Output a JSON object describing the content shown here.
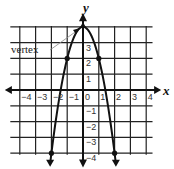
{
  "chart_data": {
    "type": "line",
    "title": "",
    "xlabel": "x",
    "ylabel": "y",
    "xlim": [
      -4.5,
      4.5
    ],
    "ylim": [
      -4.5,
      4.5
    ],
    "grid": true,
    "x_ticks": [
      "−4",
      "−3",
      "−2",
      "−1",
      "0",
      "1",
      "2",
      "3",
      "4"
    ],
    "y_ticks": [
      "−4",
      "−3",
      "−2",
      "−1",
      "1",
      "2",
      "3"
    ],
    "function": "y = 4 - 2x^2",
    "series": [
      {
        "name": "parabola",
        "x": [
          -2,
          -1,
          0,
          1,
          2
        ],
        "y": [
          -4,
          2,
          4,
          2,
          -4
        ]
      }
    ],
    "points": [
      {
        "x": -2,
        "y": -4
      },
      {
        "x": -1,
        "y": 2
      },
      {
        "x": 0,
        "y": 4
      },
      {
        "x": 1,
        "y": 2
      },
      {
        "x": 2,
        "y": -4
      }
    ],
    "annotations": [
      {
        "text": "vertex",
        "points_to": {
          "x": 0,
          "y": 4
        }
      }
    ]
  },
  "labels": {
    "x_axis": "x",
    "y_axis": "y",
    "vertex": "vertex"
  },
  "ticks": {
    "x": [
      "−4",
      "−3",
      "−2",
      "−1",
      "0",
      "1",
      "2",
      "3",
      "4"
    ],
    "y": [
      "3",
      "2",
      "1",
      "−1",
      "−2",
      "−3",
      "−4"
    ]
  }
}
